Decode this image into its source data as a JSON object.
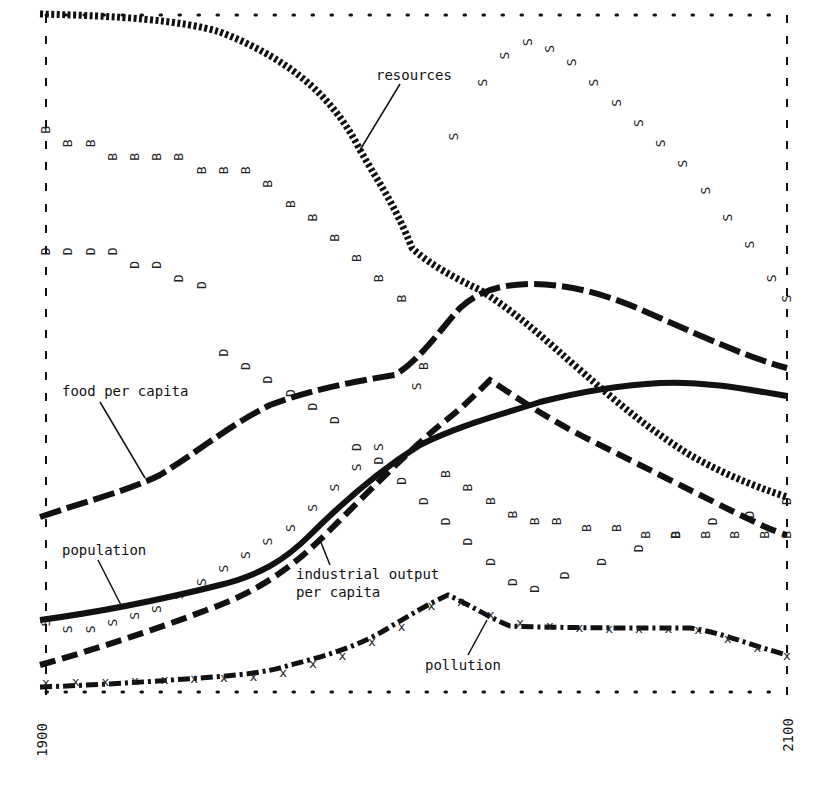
{
  "chart_data": {
    "type": "line",
    "title": "",
    "xlabel": "",
    "ylabel": "",
    "x_range": [
      1900,
      2100
    ],
    "x_tick_labels": [
      "1900",
      "2100"
    ],
    "grid": false,
    "legend": "inline labels with leader lines",
    "series": [
      {
        "name": "resources",
        "style": "heavy dotted",
        "x": [
          1900,
          1940,
          1960,
          1980,
          1992,
          2000,
          2020,
          2040,
          2060,
          2080,
          2100
        ],
        "values": [
          1.0,
          0.98,
          0.92,
          0.8,
          0.71,
          0.65,
          0.59,
          0.51,
          0.44,
          0.35,
          0.28
        ]
      },
      {
        "name": "food per capita",
        "style": "heavy long-dash",
        "x": [
          1900,
          1930,
          1950,
          1970,
          1990,
          2000,
          2012,
          2025,
          2045,
          2065,
          2080,
          2100
        ],
        "values": [
          0.26,
          0.31,
          0.37,
          0.44,
          0.46,
          0.48,
          0.54,
          0.6,
          0.6,
          0.57,
          0.52,
          0.47
        ]
      },
      {
        "name": "population",
        "style": "solid",
        "x": [
          1900,
          1930,
          1960,
          1980,
          2000,
          2015,
          2030,
          2050,
          2070,
          2100
        ],
        "values": [
          0.1,
          0.13,
          0.2,
          0.3,
          0.37,
          0.4,
          0.43,
          0.45,
          0.45,
          0.44
        ]
      },
      {
        "name": "industrial output per capita",
        "style": "heavy dashed",
        "x": [
          1900,
          1930,
          1960,
          1980,
          2000,
          2015,
          2030,
          2050,
          2070,
          2100
        ],
        "values": [
          0.04,
          0.1,
          0.19,
          0.28,
          0.36,
          0.46,
          0.42,
          0.36,
          0.29,
          0.23
        ]
      },
      {
        "name": "pollution",
        "style": "dash-dot with X markers",
        "x": [
          1900,
          1930,
          1960,
          1980,
          1995,
          2008,
          2025,
          2050,
          2075,
          2100
        ],
        "values": [
          0.01,
          0.015,
          0.02,
          0.05,
          0.09,
          0.14,
          0.1,
          0.09,
          0.09,
          0.05
        ]
      },
      {
        "name": "B (birth rate)",
        "style": "letter markers 'B'",
        "x": [
          1900,
          1906,
          1912,
          1918,
          1924,
          1930,
          1936,
          1942,
          1948,
          1954,
          1960,
          1966,
          1972,
          1978,
          1984,
          1990,
          1996,
          2002,
          2008,
          2014,
          2020,
          2026,
          2032,
          2038,
          2046,
          2054,
          2062,
          2070,
          2078,
          2086,
          2094,
          2100
        ],
        "values": [
          0.83,
          0.81,
          0.81,
          0.79,
          0.79,
          0.79,
          0.79,
          0.77,
          0.77,
          0.77,
          0.75,
          0.72,
          0.7,
          0.67,
          0.64,
          0.61,
          0.58,
          0.48,
          0.32,
          0.3,
          0.28,
          0.26,
          0.25,
          0.25,
          0.24,
          0.24,
          0.23,
          0.23,
          0.23,
          0.23,
          0.23,
          0.23
        ]
      },
      {
        "name": "D (death rate)",
        "style": "letter markers 'D'",
        "x": [
          1900,
          1906,
          1912,
          1918,
          1924,
          1930,
          1936,
          1942,
          1948,
          1954,
          1960,
          1966,
          1972,
          1978,
          1984,
          1990,
          1996,
          2002,
          2008,
          2014,
          2020,
          2026,
          2032,
          2040,
          2050,
          2060,
          2070,
          2080,
          2090,
          2100
        ],
        "values": [
          0.65,
          0.65,
          0.65,
          0.65,
          0.63,
          0.63,
          0.61,
          0.6,
          0.5,
          0.48,
          0.46,
          0.44,
          0.42,
          0.4,
          0.36,
          0.34,
          0.31,
          0.28,
          0.25,
          0.22,
          0.19,
          0.16,
          0.15,
          0.17,
          0.19,
          0.21,
          0.23,
          0.25,
          0.26,
          0.28
        ]
      },
      {
        "name": "S (services per capita)",
        "style": "letter markers 'S'",
        "x": [
          1900,
          1906,
          1912,
          1918,
          1924,
          1930,
          1936,
          1942,
          1948,
          1954,
          1960,
          1966,
          1972,
          1978,
          1984,
          1990,
          2000,
          2010,
          2018,
          2024,
          2030,
          2036,
          2042,
          2048,
          2054,
          2060,
          2066,
          2072,
          2078,
          2084,
          2090,
          2096,
          2100
        ],
        "values": [
          0.1,
          0.09,
          0.09,
          0.1,
          0.11,
          0.12,
          0.14,
          0.16,
          0.18,
          0.2,
          0.22,
          0.24,
          0.27,
          0.3,
          0.33,
          0.36,
          0.45,
          0.82,
          0.9,
          0.94,
          0.96,
          0.95,
          0.93,
          0.9,
          0.87,
          0.84,
          0.81,
          0.78,
          0.74,
          0.7,
          0.66,
          0.61,
          0.58
        ]
      }
    ],
    "annotations": [
      "resources",
      "food per capita",
      "population",
      "industrial output per capita",
      "pollution"
    ]
  },
  "labels": {
    "resources": "resources",
    "food_per_capita": "food per capita",
    "population": "population",
    "industrial_output_line1": "industrial output",
    "industrial_output_line2": "per capita",
    "pollution": "pollution",
    "x_start": "1900",
    "x_end": "2100"
  },
  "colors": {
    "ink": "#111111",
    "marker": "#222222",
    "background": "#ffffff"
  }
}
